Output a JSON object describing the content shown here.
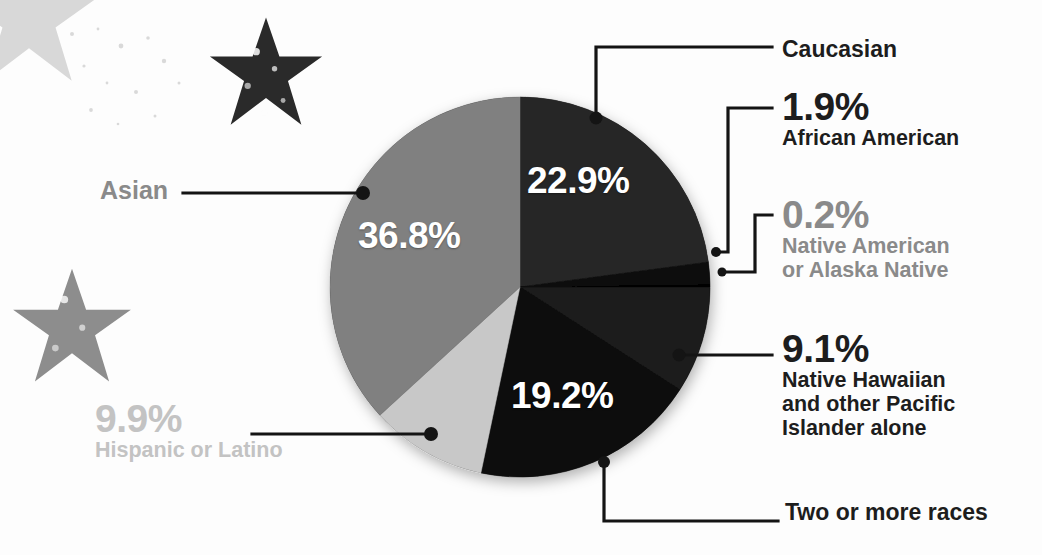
{
  "chart_data": {
    "type": "pie",
    "title": "",
    "unit": "%",
    "legend_position": "callouts",
    "categories": [
      "Caucasian",
      "African American",
      "Native American or Alaska Native",
      "Native Hawaiian and other Pacific Islander alone",
      "Two or more races",
      "Hispanic or Latino",
      "Asian"
    ],
    "values": [
      22.9,
      1.9,
      0.2,
      9.1,
      19.2,
      9.9,
      36.8
    ],
    "colors": [
      "#262626",
      "#111111",
      "#000000",
      "#1a1a1a",
      "#0d0d0d",
      "#c8c8c8",
      "#808080"
    ],
    "start_angle_deg": 0,
    "direction": "clockwise",
    "slices": [
      {
        "id": "caucasian",
        "label": "Caucasian",
        "value": 22.9,
        "value_text": "22.9%",
        "color": "#262626",
        "label_inside": true
      },
      {
        "id": "african-american",
        "label": "African American",
        "value": 1.9,
        "value_text": "1.9%",
        "color": "#111111",
        "label_inside": false
      },
      {
        "id": "native-american",
        "label": "Native American or Alaska Native",
        "value": 0.2,
        "value_text": "0.2%",
        "color": "#000000",
        "label_inside": false
      },
      {
        "id": "native-hawaiian",
        "label": "Native Hawaiian and other Pacific Islander alone",
        "value": 9.1,
        "value_text": "9.1%",
        "color": "#1a1a1a",
        "label_inside": false
      },
      {
        "id": "two-or-more-races",
        "label": "Two or more races",
        "value": 19.2,
        "value_text": "19.2%",
        "color": "#0d0d0d",
        "label_inside": true
      },
      {
        "id": "hispanic-latino",
        "label": "Hispanic or Latino",
        "value": 9.9,
        "value_text": "9.9%",
        "color": "#c8c8c8",
        "label_inside": false
      },
      {
        "id": "asian",
        "label": "Asian",
        "value": 36.8,
        "value_text": "36.8%",
        "color": "#808080",
        "label_inside": true
      }
    ]
  },
  "pie_labels": {
    "caucasian_value": "22.9%",
    "asian_value": "36.8%",
    "two_or_more_value": "19.2%"
  },
  "callouts": {
    "caucasian": {
      "percent": "",
      "name": "Caucasian"
    },
    "african": {
      "percent": "1.9%",
      "name": "African American"
    },
    "native": {
      "percent": "0.2%",
      "name_line1": "Native American",
      "name_line2": "or Alaska Native"
    },
    "hawaiian": {
      "percent": "9.1%",
      "name_line1": "Native Hawaiian",
      "name_line2": "and other Pacific",
      "name_line3": "Islander alone"
    },
    "two_or_more": {
      "percent": "",
      "name": "Two or more races"
    },
    "hispanic": {
      "percent": "9.9%",
      "name": "Hispanic or Latino"
    },
    "asian": {
      "percent": "",
      "name": "Asian"
    }
  },
  "theme": {
    "background": "#fdfdfd",
    "text_dark": "#1d1d1d",
    "text_mid": "#8a8a8a",
    "text_light": "#c3c3c3",
    "leader_line": "#141414",
    "slice_label_text": "#ffffff"
  },
  "decoration": {
    "stars": [
      {
        "name": "star-top-left-faint",
        "color": "#d2d2d2"
      },
      {
        "name": "star-top-dark",
        "color": "#2a2a2a"
      },
      {
        "name": "star-left-gray",
        "color": "#8d8d8d"
      }
    ]
  }
}
